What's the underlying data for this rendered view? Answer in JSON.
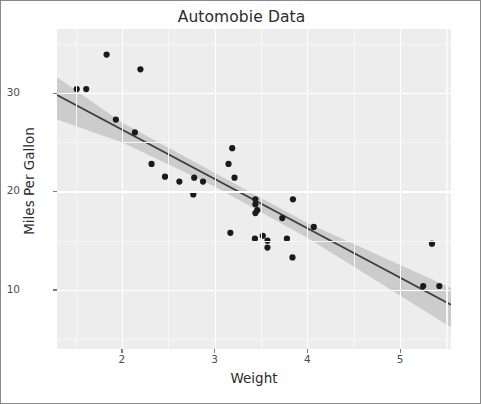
{
  "chart_data": {
    "type": "scatter",
    "title": "Automobie Data",
    "xlabel": "Weight",
    "ylabel": "Miles Per Gallon",
    "xlim": [
      1.3,
      5.55
    ],
    "ylim": [
      4.0,
      36.5
    ],
    "xticks": [
      2,
      3,
      4,
      5
    ],
    "xtick_labels": [
      "2",
      "3",
      "4",
      "5"
    ],
    "yticks": [
      10,
      20,
      30
    ],
    "ytick_labels": [
      "10",
      "20",
      "30"
    ],
    "grid": true,
    "legend": "none",
    "point_color": "#1a1a1a",
    "line_color": "#3d3d3d",
    "band_color": "#c6c6c6",
    "panel_color": "#ededed",
    "points": [
      {
        "x": 2.62,
        "y": 21.0
      },
      {
        "x": 2.875,
        "y": 21.0
      },
      {
        "x": 2.32,
        "y": 22.8
      },
      {
        "x": 3.215,
        "y": 21.4
      },
      {
        "x": 3.44,
        "y": 18.7
      },
      {
        "x": 3.46,
        "y": 18.1
      },
      {
        "x": 3.57,
        "y": 14.3
      },
      {
        "x": 3.19,
        "y": 24.4
      },
      {
        "x": 3.15,
        "y": 22.8
      },
      {
        "x": 3.44,
        "y": 19.2
      },
      {
        "x": 3.44,
        "y": 17.8
      },
      {
        "x": 4.07,
        "y": 16.4
      },
      {
        "x": 3.73,
        "y": 17.3
      },
      {
        "x": 3.78,
        "y": 15.2
      },
      {
        "x": 5.25,
        "y": 10.4
      },
      {
        "x": 5.424,
        "y": 10.4
      },
      {
        "x": 5.345,
        "y": 14.7
      },
      {
        "x": 2.2,
        "y": 32.4
      },
      {
        "x": 1.615,
        "y": 30.4
      },
      {
        "x": 1.835,
        "y": 33.9
      },
      {
        "x": 2.465,
        "y": 21.5
      },
      {
        "x": 3.52,
        "y": 15.5
      },
      {
        "x": 3.435,
        "y": 15.2
      },
      {
        "x": 3.84,
        "y": 13.3
      },
      {
        "x": 3.845,
        "y": 19.2
      },
      {
        "x": 1.935,
        "y": 27.3
      },
      {
        "x": 2.14,
        "y": 26.0
      },
      {
        "x": 1.513,
        "y": 30.4
      },
      {
        "x": 3.17,
        "y": 15.8
      },
      {
        "x": 2.77,
        "y": 19.7
      },
      {
        "x": 3.57,
        "y": 15.0
      },
      {
        "x": 2.78,
        "y": 21.4
      }
    ],
    "regression_line": {
      "x_start": 1.3,
      "x_end": 5.55,
      "y_start": 29.8,
      "y_end": 8.5,
      "slope": -5.012,
      "intercept": 36.31
    },
    "confidence_band": {
      "level": 0.95,
      "upper": [
        {
          "x": 1.3,
          "y": 31.6
        },
        {
          "x": 2.0,
          "y": 27.0
        },
        {
          "x": 3.0,
          "y": 21.9
        },
        {
          "x": 4.0,
          "y": 16.8
        },
        {
          "x": 5.55,
          "y": 10.2
        }
      ],
      "lower": [
        {
          "x": 1.3,
          "y": 27.3
        },
        {
          "x": 2.0,
          "y": 25.0
        },
        {
          "x": 3.0,
          "y": 20.5
        },
        {
          "x": 4.0,
          "y": 15.3
        },
        {
          "x": 5.55,
          "y": 6.2
        }
      ]
    }
  }
}
